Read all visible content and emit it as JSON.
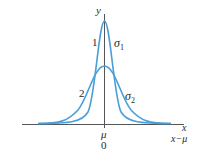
{
  "figure": {
    "type": "normal distribution curves",
    "axes": {
      "y_label": "y",
      "x_label": "x",
      "x_label_shifted": "x−μ",
      "center_label": "μ",
      "center_value": "0"
    },
    "curves": [
      {
        "id": "1",
        "label": "1",
        "sigma_label": "σ",
        "sigma_sub": "1",
        "shape": "narrow/tall"
      },
      {
        "id": "2",
        "label": "2",
        "sigma_label": "σ",
        "sigma_sub": "2",
        "shape": "wide/short"
      }
    ],
    "colors": {
      "curve": "#4a9fd8",
      "axis": "#555555",
      "text": "#2a2a2a"
    }
  }
}
